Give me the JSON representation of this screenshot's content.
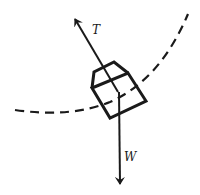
{
  "diagram": {
    "type": "free-body diagram",
    "colors": {
      "stroke": "#1a1a1a",
      "background": "#ffffff"
    },
    "path": {
      "style": "dashed",
      "description": "circular path of motion"
    },
    "object": {
      "shape": "tilted box with lid (bucket)"
    },
    "forces": [
      {
        "id": "tension",
        "label": "T",
        "direction": "up-left along rope"
      },
      {
        "id": "weight",
        "label": "W",
        "direction": "straight down"
      }
    ]
  }
}
